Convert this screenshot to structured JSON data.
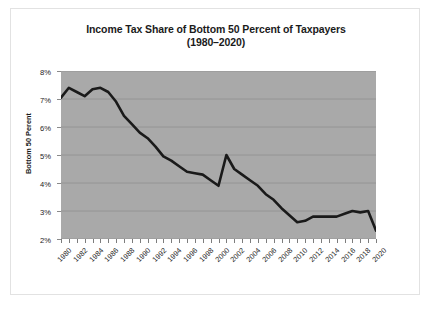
{
  "chart_data": {
    "type": "line",
    "title": "Income Tax Share of Bottom 50 Percent of Taxpayers (1980–2020)",
    "title_lines": [
      "Income Tax Share of Bottom 50 Percent of Taxpayers",
      "(1980–2020)"
    ],
    "xlabel": "",
    "ylabel": "Bottom 50 Perent",
    "ylim": [
      2,
      8
    ],
    "xlim": [
      1980,
      2020
    ],
    "y_tick_labels": [
      "8%",
      "7%",
      "6%",
      "5%",
      "4%",
      "3%",
      "2%"
    ],
    "y_tick_values": [
      8,
      7,
      6,
      5,
      4,
      3,
      2
    ],
    "x_tick_labels": [
      "1980",
      "1982",
      "1984",
      "1986",
      "1988",
      "1990",
      "1992",
      "1994",
      "1996",
      "1998",
      "2000",
      "2002",
      "2004",
      "2006",
      "2008",
      "2010",
      "2012",
      "2014",
      "2016",
      "2018",
      "2020"
    ],
    "grid": true,
    "grid_axis": "y",
    "legend": false,
    "legend_position": "none",
    "plot_background": "#a9a9a9",
    "line_color": "#1a1a1a",
    "line_width": 2.6,
    "x": [
      1980,
      1981,
      1982,
      1983,
      1984,
      1985,
      1986,
      1987,
      1988,
      1989,
      1990,
      1991,
      1992,
      1993,
      1994,
      1995,
      1996,
      1997,
      1998,
      1999,
      2000,
      2001,
      2002,
      2003,
      2004,
      2005,
      2006,
      2007,
      2008,
      2009,
      2010,
      2011,
      2012,
      2013,
      2014,
      2015,
      2016,
      2017,
      2018,
      2019,
      2020
    ],
    "values": [
      7.05,
      7.4,
      7.25,
      7.1,
      7.35,
      7.4,
      7.25,
      6.9,
      6.4,
      6.1,
      5.8,
      5.6,
      5.3,
      4.95,
      4.8,
      4.6,
      4.4,
      4.35,
      4.3,
      4.1,
      3.9,
      5.0,
      4.5,
      4.3,
      4.1,
      3.9,
      3.6,
      3.4,
      3.1,
      2.85,
      2.6,
      2.65,
      2.8,
      2.8,
      2.8,
      2.8,
      2.9,
      3.0,
      2.95,
      3.0,
      2.3
    ],
    "units": "percent",
    "annotations": []
  }
}
